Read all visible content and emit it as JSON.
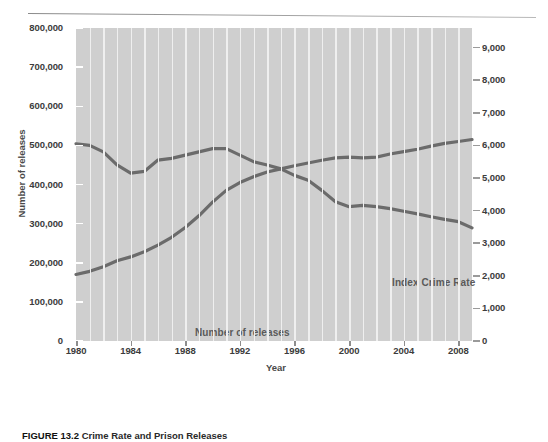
{
  "figure": {
    "caption_prefix": "FIGURE 13.2",
    "caption_text": "Crime Rate and Prison Releases"
  },
  "chart_data": {
    "type": "line",
    "title": "",
    "xlabel": "Year",
    "ylabel": "Number of releases",
    "y2label": "Index crimes per 100,000 population",
    "grid": "vertical",
    "legend": "inline-labels",
    "xlim": [
      1980,
      2009
    ],
    "ylim": [
      0,
      800000
    ],
    "y2lim": [
      0,
      9600
    ],
    "xticks": [
      1980,
      1984,
      1988,
      1992,
      1996,
      2000,
      2004,
      2008
    ],
    "xtick_labels": [
      "1980",
      "1984",
      "1988",
      "1992",
      "1996",
      "2000",
      "2004",
      "2008"
    ],
    "yticks": [
      0,
      100000,
      200000,
      300000,
      400000,
      500000,
      600000,
      700000,
      800000
    ],
    "ytick_labels": [
      "0",
      "100,000",
      "200,000",
      "300,000",
      "400,000",
      "500,000",
      "600,000",
      "700,000",
      "800,000"
    ],
    "y2ticks": [
      0,
      1000,
      2000,
      3000,
      4000,
      5000,
      6000,
      7000,
      8000,
      9000
    ],
    "y2tick_labels": [
      "0",
      "1,000",
      "2,000",
      "3,000",
      "4,000",
      "5,000",
      "6,000",
      "7,000",
      "8,000",
      "9,000"
    ],
    "x": [
      1980,
      1981,
      1982,
      1983,
      1984,
      1985,
      1986,
      1987,
      1988,
      1989,
      1990,
      1991,
      1992,
      1993,
      1994,
      1995,
      1996,
      1997,
      1998,
      1999,
      2000,
      2001,
      2002,
      2003,
      2004,
      2005,
      2006,
      2007,
      2008,
      2009
    ],
    "series": [
      {
        "name": "Number of releases",
        "label": "Number of releases",
        "axis": "left",
        "color": "#6b6b6b",
        "values": [
          170000,
          178000,
          190000,
          205000,
          215000,
          228000,
          245000,
          265000,
          290000,
          320000,
          355000,
          385000,
          405000,
          420000,
          432000,
          440000,
          448000,
          455000,
          462000,
          468000,
          470000,
          468000,
          470000,
          478000,
          484000,
          490000,
          498000,
          505000,
          510000,
          515000
        ]
      },
      {
        "name": "Index Crime Rate",
        "label": "Index Crime Rate",
        "axis": "right",
        "color": "#6b6b6b",
        "values": [
          6050,
          6000,
          5800,
          5400,
          5150,
          5200,
          5550,
          5600,
          5700,
          5800,
          5900,
          5900,
          5700,
          5500,
          5400,
          5280,
          5080,
          4930,
          4620,
          4270,
          4120,
          4160,
          4120,
          4060,
          3980,
          3900,
          3810,
          3730,
          3660,
          3470
        ]
      }
    ],
    "annotations": [
      {
        "text": "Number of releases",
        "x": 1983.2,
        "y": 205000
      },
      {
        "text": "Index Crime Rate",
        "x": 1998.5,
        "y": 4400
      }
    ]
  }
}
